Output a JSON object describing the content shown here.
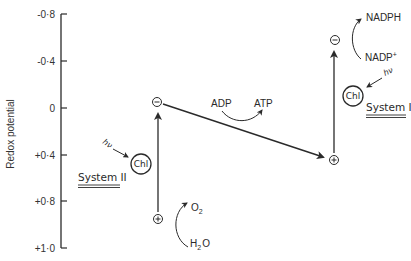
{
  "diagram": {
    "axis": {
      "label": "Redox potential",
      "ticks": [
        {
          "label": "-0·8",
          "value": -0.8
        },
        {
          "label": "-0·4",
          "value": -0.4
        },
        {
          "label": "0",
          "value": 0
        },
        {
          "label": "+0·4",
          "value": 0.4
        },
        {
          "label": "+0·8",
          "value": 0.8
        },
        {
          "label": "+1·0",
          "value": 1.0
        }
      ]
    },
    "system_ii": {
      "label": "System II",
      "pigment": "Chl",
      "light": "hν",
      "reduced_sign": "⊖",
      "oxidized_sign": "⊕",
      "water": {
        "reactant": "H",
        "reactant_sub": "2",
        "reactant_tail": "O",
        "product": "O",
        "product_sub": "2"
      }
    },
    "electron_transfer": {
      "reactant": "ADP",
      "product": "ATP"
    },
    "system_i": {
      "label": "System I",
      "pigment": "Chl",
      "light": "hν",
      "reduced_sign": "⊖",
      "oxidized_sign": "⊕",
      "nadp": {
        "reactant": "NADP",
        "reactant_sup": "+",
        "product": "NADPH"
      }
    },
    "colors": {
      "ink": "#2a2a2a",
      "background": "#ffffff"
    }
  }
}
